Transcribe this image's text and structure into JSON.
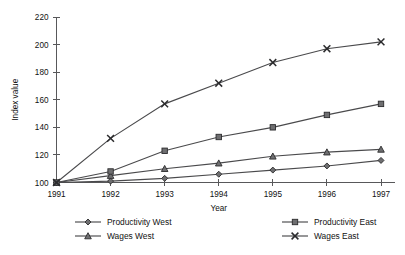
{
  "chart_data": {
    "type": "line",
    "title": "",
    "xlabel": "Year",
    "ylabel": "Index value",
    "categories": [
      "1991",
      "1992",
      "1993",
      "1994",
      "1995",
      "1996",
      "1997"
    ],
    "x": [
      1991,
      1992,
      1993,
      1994,
      1995,
      1996,
      1997
    ],
    "ylim": [
      100,
      220
    ],
    "yticks": [
      100,
      120,
      140,
      160,
      180,
      200,
      220
    ],
    "grid": false,
    "legend_position": "bottom",
    "series": [
      {
        "name": "Productivity West",
        "marker": "diamond",
        "values": [
          100,
          101,
          103,
          106,
          109,
          112,
          116
        ]
      },
      {
        "name": "Wages West",
        "marker": "triangle",
        "values": [
          100,
          105,
          110,
          114,
          119,
          122,
          124
        ]
      },
      {
        "name": "Productivity East",
        "marker": "square",
        "values": [
          100,
          108,
          123,
          133,
          140,
          149,
          157
        ]
      },
      {
        "name": "Wages East",
        "marker": "cross",
        "values": [
          100,
          132,
          157,
          172,
          187,
          197,
          202
        ]
      }
    ]
  },
  "legend": {
    "entries": [
      {
        "label": "Productivity West",
        "marker": "diamond"
      },
      {
        "label": "Wages West",
        "marker": "triangle"
      },
      {
        "label": "Productivity East",
        "marker": "square"
      },
      {
        "label": "Wages East",
        "marker": "cross"
      }
    ]
  },
  "colors": {
    "line": "#4a4a4c",
    "marker_fill": "#6e6e70",
    "marker_stroke": "#2b2b2d",
    "axis": "#58585a",
    "text": "#111111",
    "background": "#ffffff"
  }
}
